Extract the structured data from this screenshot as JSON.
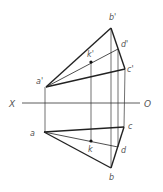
{
  "diagram": {
    "axis": {
      "left_label": "X",
      "right_label": "O",
      "x1": 22,
      "x2": 140,
      "y": 103
    },
    "points": {
      "a_prime": {
        "label": "a'",
        "x": 46,
        "y": 87
      },
      "b_prime": {
        "label": "b'",
        "x": 111,
        "y": 28
      },
      "c_prime": {
        "label": "c'",
        "x": 125,
        "y": 69
      },
      "d_prime": {
        "label": "d'",
        "x": 118,
        "y": 49
      },
      "k_prime": {
        "label": "k'",
        "x": 91,
        "y": 62
      },
      "a": {
        "label": "a",
        "x": 44,
        "y": 132
      },
      "b": {
        "label": "b",
        "x": 111,
        "y": 168
      },
      "c": {
        "label": "c",
        "x": 124,
        "y": 127
      },
      "d": {
        "label": "d",
        "x": 118,
        "y": 147
      },
      "k": {
        "label": "k",
        "x": 91,
        "y": 141
      }
    },
    "colors": {
      "line": "#222222",
      "label": "#555555"
    }
  }
}
